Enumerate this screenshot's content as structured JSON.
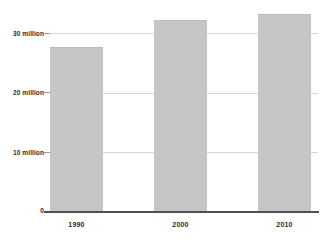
{
  "chart_data": {
    "type": "bar",
    "title": "",
    "subtitle": "",
    "xlabel": "",
    "ylabel": "",
    "categories": [
      "1990",
      "2000",
      "2010"
    ],
    "values": [
      27.6,
      32.2,
      33.2
    ],
    "value_unit": "million",
    "series": [
      {
        "name": "Population",
        "values": [
          27.6,
          32.2,
          33.2
        ]
      }
    ],
    "ylim": [
      0,
      34.2
    ],
    "yticks": [
      0,
      10,
      20,
      30
    ],
    "ytick_labels": [
      "0",
      "10 million",
      "20 million",
      "30 million"
    ],
    "xtick_labels": [
      "1990",
      "2000",
      "2010"
    ],
    "grid": true,
    "grid_axis": "y",
    "legend": false,
    "legend_position": "none",
    "annotations": []
  },
  "style": {
    "bar_color": "#c6c6c6",
    "bar_border_color": "#bdbdbd",
    "gridline_color": "#d6d6d6",
    "axis_color": "#4f4f4f",
    "tick_color": "#9a9a9a",
    "text_color": "#2b2b2b",
    "background_color": "#ffffff"
  }
}
